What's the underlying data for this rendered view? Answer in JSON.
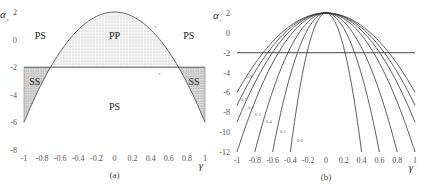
{
  "chart_data": [
    {
      "type": "area",
      "caption": "(a)",
      "xlabel": "γ",
      "ylabel": "α",
      "ylabel_sub": "r",
      "xlim": [
        -1,
        1
      ],
      "ylim": [
        -8,
        2
      ],
      "xticks": [
        "-1",
        "-0.8",
        "-0.6",
        "-0.4",
        "-0.2",
        "0",
        "0.2",
        "0.4",
        "0.6",
        "0.8",
        "1"
      ],
      "xtick_values": [
        -1,
        -0.8,
        -0.6,
        -0.4,
        -0.2,
        0,
        0.2,
        0.4,
        0.6,
        0.8,
        1
      ],
      "yticks": [
        "2",
        "0",
        "-2",
        "-4",
        "-6",
        "-8"
      ],
      "ytick_values": [
        2,
        0,
        -2,
        -4,
        -6,
        -8
      ],
      "curve": {
        "name": "s",
        "formula": "alpha = 2 - 8*gamma^2",
        "peak": 2,
        "coef": 8
      },
      "threshold": {
        "name": "r",
        "value": -2
      },
      "regions": [
        {
          "label": "PS",
          "x": -0.82,
          "y": 0.3
        },
        {
          "label": "PP",
          "x": 0.0,
          "y": 0.3
        },
        {
          "label": "PS",
          "x": 0.82,
          "y": 0.3
        },
        {
          "label": "SS",
          "x": -0.88,
          "y": -3.0
        },
        {
          "label": "SS",
          "x": 0.88,
          "y": -3.0
        },
        {
          "label": "PS",
          "x": 0.0,
          "y": -4.8
        }
      ],
      "curve_labels": [
        {
          "label": "s",
          "x": 0.45,
          "y": 1.0
        },
        {
          "label": "r",
          "x": 0.5,
          "y": -2.4
        }
      ]
    },
    {
      "type": "line",
      "caption": "(b)",
      "xlabel": "γ",
      "ylabel": "α",
      "ylabel_sub": "r",
      "xlim": [
        -1,
        1
      ],
      "ylim": [
        -12,
        2
      ],
      "xticks": [
        "-1",
        "-0.8",
        "-0.6",
        "-0.4",
        "-0.2",
        "0",
        "0.2",
        "0.4",
        "0.6",
        "0.8",
        "1"
      ],
      "xtick_values": [
        -1,
        -0.8,
        -0.6,
        -0.4,
        -0.2,
        0,
        0.2,
        0.4,
        0.6,
        0.8,
        1
      ],
      "yticks": [
        "2",
        "0",
        "-2",
        "-4",
        "-6",
        "-8",
        "-10",
        "-12"
      ],
      "ytick_values": [
        2,
        0,
        -2,
        -4,
        -6,
        -8,
        -10,
        -12
      ],
      "threshold": {
        "value": -2
      },
      "series": [
        {
          "name": "0.9",
          "peak": 2,
          "coef": 8,
          "label_at": [
            -0.9,
            -4.5
          ]
        },
        {
          "name": "0.1",
          "peak": 2,
          "coef": 9.3,
          "label_at": [
            -0.96,
            -6.9
          ]
        },
        {
          "name": "0.2",
          "peak": 2,
          "coef": 11,
          "label_at": [
            -0.88,
            -7.7
          ]
        },
        {
          "name": "0.3",
          "peak": 2,
          "coef": 14,
          "label_at": [
            -0.8,
            -8.4
          ]
        },
        {
          "name": "0.4",
          "peak": 2,
          "coef": 21.9,
          "label_at": [
            -0.68,
            -9.1
          ]
        },
        {
          "name": "0.5",
          "peak": 2,
          "coef": 38.9,
          "label_at": [
            -0.52,
            -10.1
          ]
        },
        {
          "name": "0.6",
          "peak": 2,
          "coef": 87.5,
          "label_at": [
            -0.33,
            -11.0
          ]
        }
      ]
    }
  ]
}
